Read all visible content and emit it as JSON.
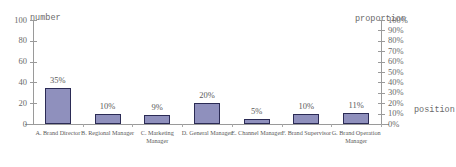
{
  "chart_data": {
    "type": "bar",
    "title": "",
    "xlabel": "position",
    "ylabel": "number",
    "y2label": "proportion",
    "categories": [
      "A. Brand Director",
      "B. Regional Manager",
      "C. Marketing Manager",
      "D. General Manager",
      "E. Channel Manager",
      "F. Brand Supervisor",
      "G. Brand Operation Manager"
    ],
    "values": [
      35,
      10,
      9,
      20,
      5,
      10,
      11
    ],
    "data_labels": [
      "35%",
      "10%",
      "9%",
      "20%",
      "5%",
      "10%",
      "11%"
    ],
    "ylim": [
      0,
      100
    ],
    "yticks": [
      0,
      20,
      40,
      60,
      80,
      100
    ],
    "ytick_labels": [
      "0",
      "20",
      "40",
      "60",
      "80",
      "100"
    ],
    "y2lim": [
      0,
      100
    ],
    "y2ticks": [
      0,
      10,
      20,
      30,
      40,
      50,
      60,
      70,
      80,
      90,
      100
    ],
    "y2tick_labels": [
      "0%",
      "10%",
      "20%",
      "30%",
      "40%",
      "50%",
      "60%",
      "70%",
      "80%",
      "90%",
      "100%"
    ],
    "grid": false,
    "legend": "none",
    "bar_fill": "#8f90bd",
    "bar_border": "#2b2b55",
    "axis_color": "#9a9a9a"
  },
  "axes": {
    "left_title": "number",
    "right_title": "proportion",
    "bottom_title": "position"
  }
}
